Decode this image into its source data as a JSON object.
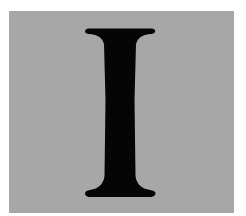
{
  "image": {
    "letter": "I",
    "colors": {
      "background": "#ffffff",
      "panel": "#a7a7a7",
      "glyph": "#050505"
    }
  }
}
